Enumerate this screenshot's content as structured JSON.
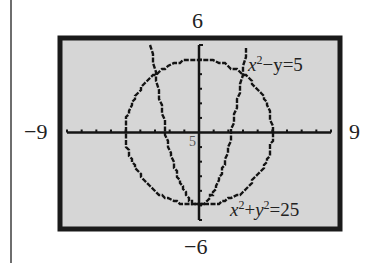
{
  "chart_data": {
    "type": "line",
    "title": "",
    "xlabel": "",
    "ylabel": "",
    "xlim": [
      -9,
      9
    ],
    "ylim": [
      -6,
      6
    ],
    "x_tick_step": 1,
    "y_tick_step": 1,
    "grid": false,
    "window_labels": {
      "ymax": "6",
      "ymin": "−6",
      "xmin": "−9",
      "xmax": "9",
      "origin_note": "5"
    },
    "series": [
      {
        "name": "x²−y=5",
        "kind": "parabola",
        "equation": "y = x^2 - 5",
        "vertex": [
          0,
          -5
        ],
        "x_intercepts": [
          -2.236,
          2.236
        ]
      },
      {
        "name": "x²+y²=25",
        "kind": "circle",
        "equation": "x^2 + y^2 = 25",
        "center": [
          0,
          0
        ],
        "radius": 5
      }
    ],
    "intersections": [
      [
        -3,
        4
      ],
      [
        3,
        4
      ],
      [
        0,
        -5
      ]
    ],
    "annotations": [
      {
        "text": "x²−y=5",
        "near": [
          3.5,
          4.5
        ]
      },
      {
        "text": "x²+y²=25",
        "near": [
          2.5,
          -5
        ]
      }
    ]
  },
  "labels": {
    "top": "6",
    "bottom": "−6",
    "left": "−9",
    "right": "9",
    "origin": "5",
    "parabola_eq_base": "x",
    "parabola_eq_sup": "2",
    "parabola_eq_rest": "−y=5",
    "circle_eq_x": "x",
    "circle_eq_sup1": "2",
    "circle_eq_plus": "+",
    "circle_eq_y": "y",
    "circle_eq_sup2": "2",
    "circle_eq_rest": "=25"
  },
  "colors": {
    "screen_bg": "#d6d6d6",
    "frame": "#1a1a1a",
    "ink": "#141414"
  }
}
